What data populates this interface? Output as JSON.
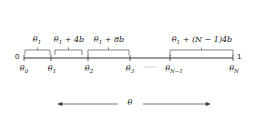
{
  "diagram": {
    "axis": {
      "start_label": "0",
      "end_label": "1"
    },
    "ticks": [
      {
        "sym": "θ",
        "sub": "0"
      },
      {
        "sym": "θ",
        "sub": "1"
      },
      {
        "sym": "θ",
        "sub": "2"
      },
      {
        "sym": "θ",
        "sub": "3"
      },
      {
        "sym": "θ",
        "sub": "N−1"
      },
      {
        "sym": "θ",
        "sub": "N"
      }
    ],
    "ellipsis": "·······",
    "intervals": [
      {
        "sym": "θ",
        "sub": "1",
        "rest": ""
      },
      {
        "sym": "θ",
        "sub": "1",
        "rest": " + 4b"
      },
      {
        "sym": "θ",
        "sub": "1",
        "rest": " + 8b"
      },
      {
        "sym": "θ",
        "sub": "1",
        "rest": " + (N − 1)4b"
      }
    ],
    "range_arrow": {
      "label": "θ"
    },
    "colors": {
      "line": "#333333",
      "brace": "#555555",
      "text": "#222222"
    }
  }
}
